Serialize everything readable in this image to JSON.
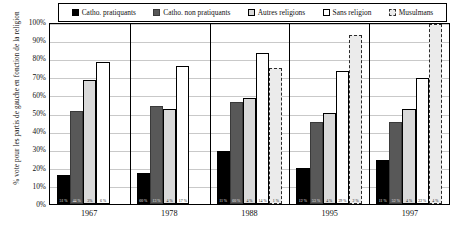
{
  "chart_data": {
    "type": "bar",
    "title": "",
    "xlabel": "",
    "ylabel": "% vote pour les partis de gauche en fonction de la religion",
    "ylim": [
      0,
      100
    ],
    "grid": true,
    "legend_position": "top",
    "categories": [
      "1967",
      "1978",
      "1988",
      "1995",
      "1997"
    ],
    "ytick_labels": [
      "0%",
      "10%",
      "20%",
      "30%",
      "40%",
      "50%",
      "60%",
      "70%",
      "80%",
      "90%",
      "100%"
    ],
    "series": [
      {
        "name": "Catho. pratiquants",
        "values": [
          16,
          17,
          29,
          20,
          24
        ]
      },
      {
        "name": "Catho. non pratiquants",
        "values": [
          51,
          54,
          56,
          45,
          45
        ]
      },
      {
        "name": "Autres religions",
        "values": [
          68,
          52,
          58,
          50,
          52
        ]
      },
      {
        "name": "Sans religion",
        "values": [
          78,
          76,
          83,
          73,
          69
        ]
      },
      {
        "name": "Musulmans",
        "values": [
          null,
          null,
          75,
          93,
          99
        ]
      }
    ],
    "base_notes": [
      [
        "51 %",
        "44 %",
        "3%",
        "6 %",
        ""
      ],
      [
        "60 %",
        "13 %",
        "4 %",
        "17 %",
        ""
      ],
      [
        "11 %",
        "60 %",
        "4 %",
        "14 %",
        "1 %"
      ],
      [
        "12 %",
        "53 %",
        "4 %",
        "29 %",
        "2 %"
      ],
      [
        "11 %",
        "52 %",
        "4 %",
        "22 %",
        "4 %"
      ]
    ]
  },
  "colors": {
    "catho_pratiquants": "#000000",
    "catho_non_pratiquants": "#585858",
    "autres_religions": "#d9d9d9",
    "sans_religion": "#ffffff",
    "musulmans": "#ebebeb",
    "gridline": "#c9c9c9",
    "axis": "#000000"
  }
}
